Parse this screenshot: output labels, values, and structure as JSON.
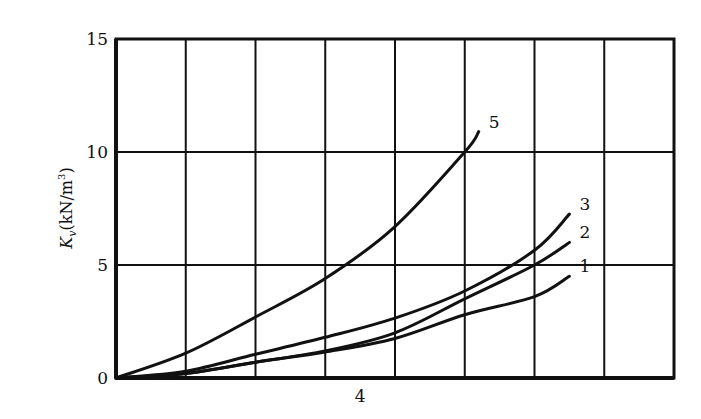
{
  "chart_data": {
    "type": "line",
    "title": "",
    "xlabel": "",
    "ylabel": "K_v(kN/m³)",
    "ylabel_parts": {
      "symbol": "K",
      "subscript": "v",
      "unit": "(kN/m",
      "superscript": "3",
      "close": ")"
    },
    "ylim": [
      0,
      15
    ],
    "yticks": [
      0,
      5,
      10,
      15
    ],
    "xtick_labels": [
      {
        "label": "4",
        "grid_position": 3.5
      }
    ],
    "x_grid_columns": 8,
    "grid": true,
    "legend": "inline curve numbers at line ends",
    "x_units": "grid columns (0-8)",
    "series": [
      {
        "name": "1",
        "points": [
          [
            0,
            0
          ],
          [
            1,
            0.2
          ],
          [
            2,
            0.7
          ],
          [
            3,
            1.15
          ],
          [
            4,
            1.75
          ],
          [
            5,
            2.8
          ],
          [
            6,
            3.6
          ],
          [
            6.5,
            4.5
          ]
        ]
      },
      {
        "name": "2",
        "points": [
          [
            0,
            0
          ],
          [
            1,
            0.2
          ],
          [
            2,
            0.7
          ],
          [
            3,
            1.2
          ],
          [
            4,
            2.0
          ],
          [
            5,
            3.5
          ],
          [
            6,
            5.0
          ],
          [
            6.5,
            6.0
          ]
        ]
      },
      {
        "name": "3",
        "points": [
          [
            0,
            0
          ],
          [
            1,
            0.3
          ],
          [
            2,
            1.05
          ],
          [
            3,
            1.8
          ],
          [
            4,
            2.65
          ],
          [
            5,
            3.85
          ],
          [
            6,
            5.65
          ],
          [
            6.5,
            7.25
          ]
        ]
      },
      {
        "name": "5",
        "points": [
          [
            0,
            0
          ],
          [
            1,
            1.1
          ],
          [
            2,
            2.7
          ],
          [
            3,
            4.4
          ],
          [
            4,
            6.7
          ],
          [
            5,
            10.0
          ],
          [
            5.2,
            10.9
          ]
        ]
      }
    ]
  }
}
